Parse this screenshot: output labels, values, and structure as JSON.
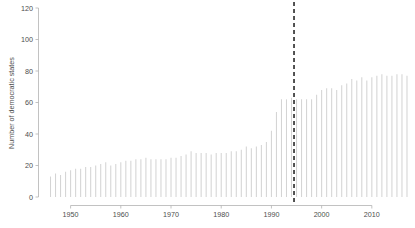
{
  "chart_data": {
    "type": "bar",
    "title": "",
    "subtitle": "",
    "xlabel": "",
    "ylabel": "Number of democratic states",
    "xlim": [
      1945.2,
      2017.8
    ],
    "ylim": [
      0,
      120
    ],
    "grid": false,
    "legend": null,
    "y_ticks": [
      0,
      20,
      40,
      60,
      80,
      100,
      120
    ],
    "y_tick_labels": [
      "0",
      "20",
      "40",
      "60",
      "80",
      "100",
      "120"
    ],
    "x_ticks": [
      1950,
      1960,
      1970,
      1980,
      1990,
      2000,
      2010
    ],
    "x_tick_labels": [
      "1950",
      "1960",
      "1970",
      "1980",
      "1990",
      "2000",
      "2010"
    ],
    "x_minor_ticks_every": 1,
    "bar_color": "#d4d4d4",
    "annotations": [
      {
        "name": "event-reference-line",
        "type": "vline",
        "x": 1994.5,
        "style": "dashed",
        "color": "#1a1a1a",
        "label": ""
      }
    ],
    "categories": [
      1946,
      1947,
      1948,
      1949,
      1950,
      1951,
      1952,
      1953,
      1954,
      1955,
      1956,
      1957,
      1958,
      1959,
      1960,
      1961,
      1962,
      1963,
      1964,
      1965,
      1966,
      1967,
      1968,
      1969,
      1970,
      1971,
      1972,
      1973,
      1974,
      1975,
      1976,
      1977,
      1978,
      1979,
      1980,
      1981,
      1982,
      1983,
      1984,
      1985,
      1986,
      1987,
      1988,
      1989,
      1990,
      1991,
      1992,
      1993,
      1994,
      1995,
      1996,
      1997,
      1998,
      1999,
      2000,
      2001,
      2002,
      2003,
      2004,
      2005,
      2006,
      2007,
      2008,
      2009,
      2010,
      2011,
      2012,
      2013,
      2014,
      2015,
      2016,
      2017
    ],
    "values": [
      13,
      15,
      14,
      16,
      17,
      18,
      18,
      19,
      19,
      20,
      21,
      22,
      20,
      21,
      22,
      23,
      23,
      24,
      24,
      25,
      24,
      24,
      24,
      24,
      25,
      25,
      26,
      27,
      29,
      28,
      28,
      28,
      27,
      28,
      28,
      28,
      29,
      29,
      30,
      32,
      31,
      32,
      33,
      35,
      42,
      54,
      62,
      62,
      63,
      62,
      62,
      62,
      62,
      65,
      68,
      69,
      69,
      68,
      71,
      72,
      75,
      74,
      76,
      74,
      76,
      77,
      78,
      77,
      77,
      78,
      78,
      77
    ]
  }
}
